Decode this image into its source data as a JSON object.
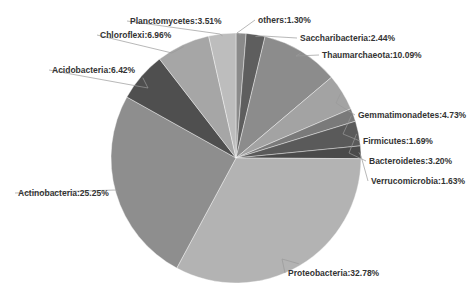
{
  "chart_data": {
    "type": "pie",
    "title": "",
    "start_angle_deg": 0,
    "direction": "clockwise",
    "slices": [
      {
        "label": "others",
        "value": 1.3,
        "text": "others:1.30%",
        "color": "#8a8a8a"
      },
      {
        "label": "Saccharibacteria",
        "value": 2.44,
        "text": "Saccharibacteria:2.44%",
        "color": "#5e5e5e"
      },
      {
        "label": "Thaumarchaeota",
        "value": 10.09,
        "text": "Thaumarchaeota:10.09%",
        "color": "#8c8c8c"
      },
      {
        "label": "Gemmatimonadetes",
        "value": 4.73,
        "text": "Gemmatimonadetes:4.73%",
        "color": "#a3a3a3"
      },
      {
        "label": "Firmicutes",
        "value": 1.69,
        "text": "Firmicutes:1.69%",
        "color": "#7a7a7a"
      },
      {
        "label": "Bacteroidetes",
        "value": 3.2,
        "text": "Bacteroidetes:3.20%",
        "color": "#5a5a5a"
      },
      {
        "label": "Verrucomicrobia",
        "value": 1.63,
        "text": "Verrucomicrobia:1.63%",
        "color": "#4a4a4a"
      },
      {
        "label": "Proteobacteria",
        "value": 32.78,
        "text": "Proteobacteria:32.78%",
        "color": "#b3b3b3"
      },
      {
        "label": "Actinobacteria",
        "value": 25.25,
        "text": "Actinobacteria:25.25%",
        "color": "#8e8e8e"
      },
      {
        "label": "Acidobacteria",
        "value": 6.42,
        "text": "Acidobacteria:6.42%",
        "color": "#4f4f4f"
      },
      {
        "label": "Chloroflexi",
        "value": 6.96,
        "text": "Chloroflexi:6.96%",
        "color": "#a6a6a6"
      },
      {
        "label": "Planctomycetes",
        "value": 3.51,
        "text": "Planctomycetes:3.51%",
        "color": "#bdbdbd"
      }
    ],
    "legend": "none",
    "labels": "outside with leader lines"
  },
  "layout": {
    "cx": 236,
    "cy": 158,
    "r": 125,
    "labels": [
      {
        "x": 258,
        "y": 23,
        "anchor": "start",
        "lx": 237,
        "ly": 33
      },
      {
        "x": 300,
        "y": 41,
        "anchor": "start",
        "lx": 263,
        "ly": 36
      },
      {
        "x": 322,
        "y": 58,
        "anchor": "start",
        "lx": 296,
        "ly": 56
      },
      {
        "x": 358,
        "y": 118,
        "anchor": "start",
        "lx": 336,
        "ly": 103
      },
      {
        "x": 363,
        "y": 144,
        "anchor": "start",
        "lx": 343,
        "ly": 134
      },
      {
        "x": 369,
        "y": 164,
        "anchor": "start",
        "lx": 349,
        "ly": 153
      },
      {
        "x": 371,
        "y": 184,
        "anchor": "start",
        "lx": 361,
        "ly": 156
      },
      {
        "x": 288,
        "y": 276,
        "anchor": "start",
        "lx": 282,
        "ly": 259
      },
      {
        "x": 18,
        "y": 196,
        "anchor": "start",
        "lx": 116,
        "ly": 190
      },
      {
        "x": 52,
        "y": 73,
        "anchor": "start",
        "lx": 148,
        "ly": 88
      },
      {
        "x": 100,
        "y": 38,
        "anchor": "start",
        "lx": 172,
        "ly": 53
      },
      {
        "x": 130,
        "y": 24,
        "anchor": "start",
        "lx": 220,
        "ly": 34
      }
    ]
  }
}
